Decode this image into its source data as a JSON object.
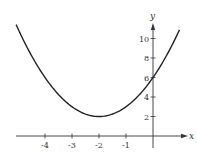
{
  "chart_data": {
    "type": "line",
    "title": "",
    "xlabel": "x",
    "ylabel": "y",
    "function": "y = (x + 2)^2 + 2",
    "x_ticks": [
      -4,
      -3,
      -2,
      -1
    ],
    "y_ticks": [
      2,
      4,
      6,
      8,
      10
    ],
    "x_tick_labels": [
      "-4",
      "-3",
      "-2",
      "-1"
    ],
    "y_tick_labels": [
      "2",
      "4",
      "6",
      "8",
      "10"
    ],
    "xlim": [
      -5.1,
      1.2
    ],
    "ylim": [
      0,
      11.5
    ],
    "grid": false,
    "legend": null,
    "series": [
      {
        "name": "parabola",
        "x": [
          -5,
          -4.5,
          -4,
          -3.5,
          -3,
          -2.5,
          -2,
          -1.5,
          -1,
          -0.5,
          0,
          0.5,
          1
        ],
        "values": [
          11,
          8.25,
          6,
          4.25,
          3,
          2.25,
          2,
          2.25,
          3,
          4.25,
          6,
          8.25,
          11
        ]
      }
    ],
    "annotations": {
      "vertex": [
        -2,
        2
      ],
      "y_intercept": [
        0,
        6
      ]
    },
    "colors": {
      "curve": "#222222",
      "axes": "#333333"
    }
  }
}
